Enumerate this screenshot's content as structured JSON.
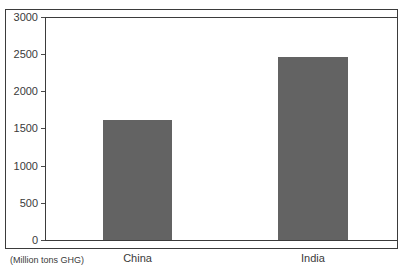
{
  "chart_data": {
    "type": "bar",
    "title": "",
    "subtitle": "",
    "categories": [
      "China",
      "India"
    ],
    "values": [
      1620,
      2460
    ],
    "series": [
      {
        "name": "GHG emissions",
        "values": [
          1620,
          2460
        ]
      }
    ],
    "xlabel": "",
    "ylabel": "",
    "unit_note": "(Million tons GHG)",
    "ylim": [
      0,
      3000
    ],
    "ytick_values": [
      0,
      500,
      1000,
      1500,
      2000,
      2500,
      3000
    ],
    "ytick_labels": [
      "0",
      "500",
      "1000",
      "1500",
      "2000",
      "2500",
      "3000"
    ],
    "grid": false,
    "legend": null,
    "legend_position": "none",
    "bar_color": "#636363",
    "axis_color": "#3b3b3b",
    "text_color": "#3a3a3a",
    "background_color": "#ffffff",
    "annotations": []
  }
}
